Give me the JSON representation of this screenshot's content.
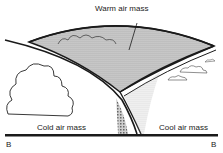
{
  "diagram": {
    "labels": {
      "warm": "Warm air mass",
      "cold": "Cold air mass",
      "cool": "Cool air mass",
      "left_marker": "B",
      "right_marker": "B"
    },
    "colors": {
      "line": "#1a1a1a",
      "fill_warm": "#bdbdbd",
      "background": "#ffffff"
    }
  }
}
